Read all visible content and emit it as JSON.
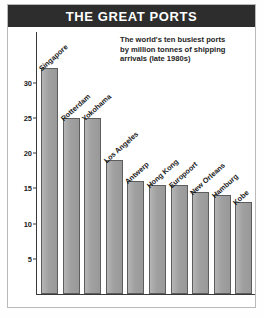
{
  "header": {
    "title": "THE GREAT PORTS"
  },
  "subtitle": {
    "line1": "The world's ten busiest ports",
    "line2": "by million tonnes of shipping",
    "line3": "arrivals (late 1980s)",
    "full": "The world's ten busiest ports by million tonnes of shipping arrivals (late 1980s)"
  },
  "colors": {
    "header_bg": "#2d2d2d",
    "header_text": "#ffffff",
    "bar_fill": "#a3a3a3",
    "bar_stroke": "#5d5d5d",
    "axis": "#3a3a3a",
    "frame_border": "#b9b9b9",
    "page_bg": "#ffffff"
  },
  "chart_data": {
    "type": "bar",
    "title": "THE GREAT PORTS",
    "subtitle": "The world's ten busiest ports by million tonnes of shipping arrivals (late 1980s)",
    "categories": [
      "Singapore",
      "Rotterdam",
      "Yokohama",
      "Los Angeles",
      "Antwerp",
      "Hong Kong",
      "Europoort",
      "New Orleans",
      "Hamburg",
      "Kobe"
    ],
    "values": [
      32,
      25,
      25,
      19,
      16,
      15.5,
      15.5,
      14.5,
      14,
      13
    ],
    "xlabel": "",
    "ylabel": "",
    "ylim": [
      0,
      33
    ],
    "yticks": [
      5,
      10,
      15,
      20,
      25,
      30
    ],
    "ytick_labels": [
      "5",
      "10",
      "15",
      "20",
      "25",
      "30"
    ],
    "grid": false,
    "legend": false,
    "label_rotation": -42,
    "units": "million tonnes"
  }
}
